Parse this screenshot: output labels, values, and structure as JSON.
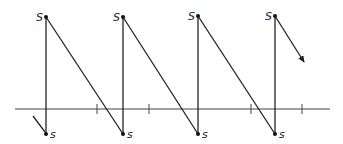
{
  "diagram": {
    "type": "sawtooth",
    "axis": {
      "x1": 15,
      "x2": 330,
      "y": 109
    },
    "ticks": [
      97,
      149,
      251,
      302
    ],
    "peaks": [
      {
        "x": 46,
        "top_y": 17,
        "bottom_y": 134,
        "top_label": "S",
        "bottom_label": "s"
      },
      {
        "x": 123,
        "top_y": 17,
        "bottom_y": 134,
        "top_label": "S",
        "bottom_label": "s"
      },
      {
        "x": 198,
        "top_y": 16,
        "bottom_y": 134,
        "top_label": "S",
        "bottom_label": "s"
      },
      {
        "x": 275,
        "top_y": 16,
        "bottom_y": 134,
        "top_label": "S",
        "bottom_label": "s"
      }
    ],
    "lead_in": {
      "x1": 33,
      "y1": 116,
      "x2": 45,
      "y2": 132
    },
    "arrow": {
      "x1": 275,
      "y1": 16,
      "x2": 304,
      "y2": 62
    }
  }
}
